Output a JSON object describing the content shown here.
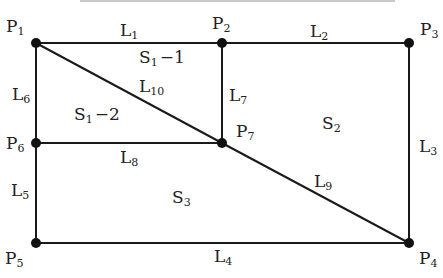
{
  "diagram": {
    "type": "planar-partition",
    "colors": {
      "line": "#1a1a1a",
      "point": "#111111",
      "text": "#222222",
      "top_rule": "#c8c8c8"
    },
    "points": [
      {
        "id": "P1",
        "base": "P",
        "sub": "1",
        "x": 36,
        "y": 43,
        "label_x": 6,
        "label_y": 32
      },
      {
        "id": "P2",
        "base": "P",
        "sub": "2",
        "x": 222,
        "y": 43,
        "label_x": 212,
        "label_y": 29
      },
      {
        "id": "P3",
        "base": "P",
        "sub": "3",
        "x": 409,
        "y": 43,
        "label_x": 420,
        "label_y": 35
      },
      {
        "id": "P4",
        "base": "P",
        "sub": "4",
        "x": 409,
        "y": 243,
        "label_x": 419,
        "label_y": 264
      },
      {
        "id": "P5",
        "base": "P",
        "sub": "5",
        "x": 36,
        "y": 243,
        "label_x": 5,
        "label_y": 264
      },
      {
        "id": "P6",
        "base": "P",
        "sub": "6",
        "x": 36,
        "y": 143,
        "label_x": 6,
        "label_y": 149
      },
      {
        "id": "P7",
        "base": "P",
        "sub": "7",
        "x": 222,
        "y": 143,
        "label_x": 236,
        "label_y": 137
      }
    ],
    "lines": [
      {
        "id": "L1",
        "base": "L",
        "sub": "1",
        "from": "P1",
        "to": "P2",
        "label_x": 120,
        "label_y": 36
      },
      {
        "id": "L2",
        "base": "L",
        "sub": "2",
        "from": "P2",
        "to": "P3",
        "label_x": 310,
        "label_y": 37
      },
      {
        "id": "L3",
        "base": "L",
        "sub": "3",
        "from": "P3",
        "to": "P4",
        "label_x": 419,
        "label_y": 152
      },
      {
        "id": "L4",
        "base": "L",
        "sub": "4",
        "from": "P5",
        "to": "P4",
        "label_x": 214,
        "label_y": 262
      },
      {
        "id": "L5",
        "base": "L",
        "sub": "5",
        "from": "P6",
        "to": "P5",
        "label_x": 11,
        "label_y": 196
      },
      {
        "id": "L6",
        "base": "L",
        "sub": "6",
        "from": "P1",
        "to": "P6",
        "label_x": 12,
        "label_y": 100
      },
      {
        "id": "L7",
        "base": "L",
        "sub": "7",
        "from": "P2",
        "to": "P7",
        "label_x": 229,
        "label_y": 101
      },
      {
        "id": "L8",
        "base": "L",
        "sub": "8",
        "from": "P6",
        "to": "P7",
        "label_x": 120,
        "label_y": 163
      },
      {
        "id": "L9",
        "base": "L",
        "sub": "9",
        "from": "P7",
        "to": "P4",
        "label_x": 314,
        "label_y": 187
      },
      {
        "id": "L10",
        "base": "L",
        "sub": "10",
        "from": "P1",
        "to": "P7",
        "label_x": 139,
        "label_y": 92
      }
    ],
    "regions": [
      {
        "id": "S1-1",
        "base": "S",
        "sub": "1",
        "suffix": "−1",
        "label_x": 139,
        "label_y": 63
      },
      {
        "id": "S1-2",
        "base": "S",
        "sub": "1",
        "suffix": "−2",
        "label_x": 74,
        "label_y": 120
      },
      {
        "id": "S2",
        "base": "S",
        "sub": "2",
        "suffix": "",
        "label_x": 322,
        "label_y": 129
      },
      {
        "id": "S3",
        "base": "S",
        "sub": "3",
        "suffix": "",
        "label_x": 172,
        "label_y": 203
      }
    ]
  }
}
